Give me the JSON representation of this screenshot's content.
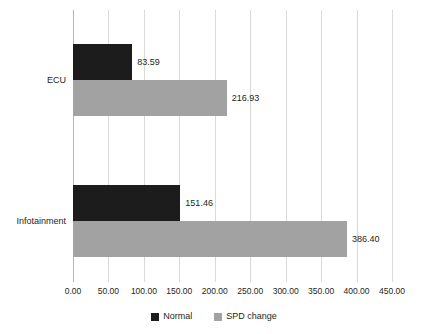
{
  "chart_data": {
    "type": "bar",
    "orientation": "horizontal",
    "title": "",
    "xlabel": "",
    "ylabel": "",
    "categories": [
      "ECU",
      "Infotainment"
    ],
    "series": [
      {
        "name": "Normal",
        "color": "#1c1c1c",
        "values": [
          83.59,
          151.46
        ],
        "value_labels": [
          "83.59",
          "151.46"
        ]
      },
      {
        "name": "SPD change",
        "color": "#a2a2a2",
        "values": [
          216.93,
          386.4
        ],
        "value_labels": [
          "216.93",
          "386.40"
        ]
      }
    ],
    "xlim": [
      0,
      450
    ],
    "xticks": [
      0,
      50,
      100,
      150,
      200,
      250,
      300,
      350,
      400,
      450
    ],
    "xtick_labels": [
      "0.00",
      "50.00",
      "100.00",
      "150.00",
      "200.00",
      "250.00",
      "300.00",
      "350.00",
      "400.00",
      "450.00"
    ],
    "grid": true,
    "grid_axis": "x",
    "grid_color": "#d9d9d9",
    "legend_position": "bottom",
    "background": "#ffffff"
  },
  "legend": {
    "items": [
      {
        "label": "Normal",
        "color": "#1c1c1c"
      },
      {
        "label": "SPD change",
        "color": "#a2a2a2"
      }
    ]
  },
  "axis": {
    "tick_labels": [
      "0.00",
      "50.00",
      "100.00",
      "150.00",
      "200.00",
      "250.00",
      "300.00",
      "350.00",
      "400.00",
      "450.00"
    ]
  },
  "categories": {
    "ecu": "ECU",
    "infotainment": "Infotainment"
  },
  "values": {
    "ecu_normal": "83.59",
    "ecu_spd": "216.93",
    "infotainment_normal": "151.46",
    "infotainment_spd": "386.40"
  }
}
